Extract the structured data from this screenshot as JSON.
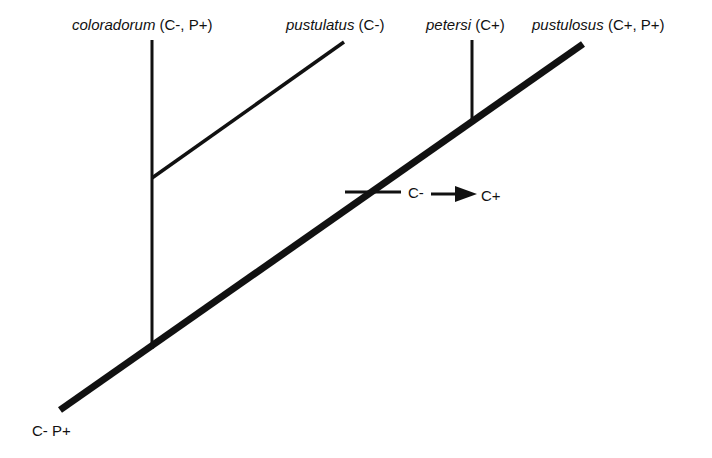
{
  "diagram": {
    "type": "cladogram",
    "taxa": [
      {
        "name": "coloradorum",
        "traits": "(C-, P+)"
      },
      {
        "name": "pustulatus",
        "traits": "(C-)"
      },
      {
        "name": "petersi",
        "traits": "(C+)"
      },
      {
        "name": "pustulosus",
        "traits": "(C+, P+)"
      }
    ],
    "root_label": "C- P+",
    "transition": {
      "from": "C-",
      "to": "C+"
    },
    "colors": {
      "line": "#111111",
      "background": "#ffffff"
    }
  }
}
